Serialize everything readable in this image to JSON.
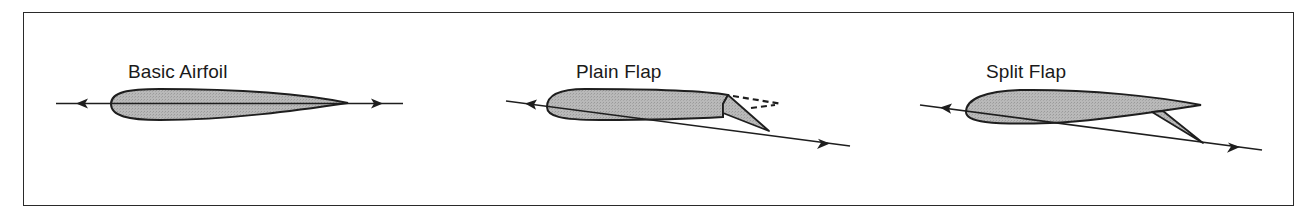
{
  "figure": {
    "panels": [
      {
        "id": "basic-airfoil",
        "label": "Basic Airfoil"
      },
      {
        "id": "plain-flap",
        "label": "Plain Flap"
      },
      {
        "id": "split-flap",
        "label": "Split Flap"
      }
    ],
    "colors": {
      "airfoil_fill": "#b4b4b4",
      "outline": "#1e1e1e",
      "border": "#2a2a2a",
      "background": "#ffffff"
    }
  }
}
